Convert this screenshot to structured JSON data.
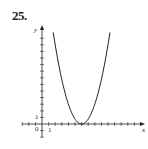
{
  "problem": {
    "number": "25."
  },
  "chart_data": {
    "type": "line",
    "title": "",
    "xlabel": "x",
    "ylabel": "y",
    "tick_labels": {
      "x": [
        "1"
      ],
      "y": [
        "1"
      ],
      "origin": "0"
    },
    "xlim": [
      -3,
      17
    ],
    "ylim": [
      -2,
      14
    ],
    "grid": false,
    "legend": null,
    "unit_px": {
      "x": 6.6,
      "y": 6.6
    },
    "origin_px": [
      42,
      124
    ],
    "series": [
      {
        "name": "parabola",
        "equation_estimate": "y = 0.75 (x - 6)^2",
        "vertex": [
          6,
          0
        ],
        "x": [
          1.7,
          2,
          3,
          4,
          5,
          6,
          7,
          8,
          9,
          10,
          10.3
        ],
        "y": [
          13.9,
          12,
          6.75,
          3,
          0.75,
          0,
          0.75,
          3,
          6.75,
          12,
          13.9
        ]
      }
    ],
    "colors": {
      "ink": "#231f20",
      "background": "#ffffff"
    }
  }
}
